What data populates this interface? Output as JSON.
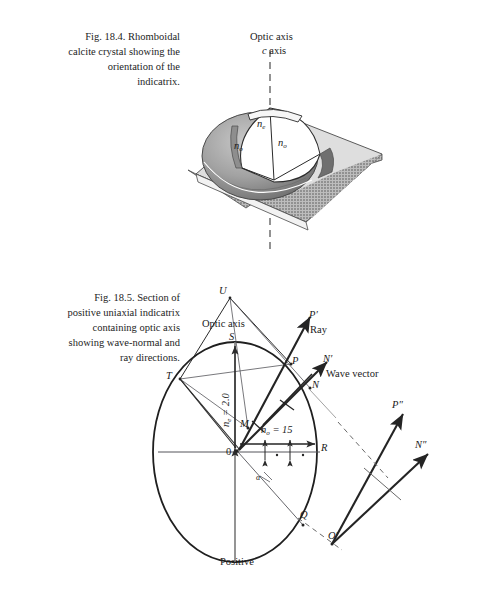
{
  "page": {
    "background": "#ffffff",
    "width": 491,
    "height": 596
  },
  "figure_1": {
    "number": "Fig. 18.4.",
    "caption_lines": [
      "Fig. 18.4.   Rhomboidal",
      "calcite crystal showing the",
      "orientation of the",
      "indicatrix."
    ],
    "labels": {
      "optic_axis": "Optic axis",
      "c_axis": "c axis",
      "n_e": "n",
      "n_e_sub": "e",
      "n_o_left": "n",
      "n_o_left_sub": "o",
      "n_o_right": "n",
      "n_o_right_sub": "o"
    },
    "colors": {
      "rhomb_top_face": "#d9d9d9",
      "rhomb_shadow_face": "#a9a9a9",
      "indicatrix_body": "#9a9a9a",
      "indicatrix_cut": "#ffffff",
      "outline": "#2b2b2b"
    }
  },
  "figure_2": {
    "number": "Fig. 18.5.",
    "caption_lines": [
      "Fig. 18.5.   Section of",
      "positive uniaxial indicatrix",
      "containing optic axis",
      "showing wave-normal and",
      "ray directions."
    ],
    "labels": {
      "U": "U",
      "optic_axis": "Optic axis",
      "S": "S",
      "T": "T",
      "P": "P",
      "P_prime": "P′",
      "ray": "Ray",
      "N": "N",
      "N_prime": "N′",
      "wave_vector": "Wave vector",
      "M": "M",
      "O": "0",
      "R": "R",
      "Q": "Q",
      "O_prime": "O′",
      "P_double_prime": "P″",
      "N_double_prime": "N″",
      "positive": "Positive",
      "alpha": "α"
    },
    "values": {
      "n_e_label": "n",
      "n_e_sub": "e",
      "n_e_value": " = 2.0",
      "n_o_label": "n",
      "n_o_sub": "o",
      "n_o_value": " = 15"
    },
    "colors": {
      "ellipse_stroke": "#1f1f1f",
      "ray_stroke": "#2a2a2a",
      "thin_stroke": "#55555a",
      "dashed_stroke": "#6a6a6a"
    }
  }
}
